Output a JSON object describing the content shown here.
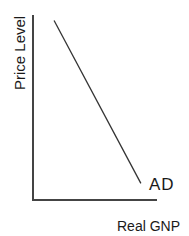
{
  "chart_data": {
    "type": "line",
    "title": "",
    "xlabel": "Real GNP",
    "ylabel": "Price Level",
    "xlim": [
      0,
      1
    ],
    "ylim": [
      0,
      1
    ],
    "grid": false,
    "ticks": false,
    "series": [
      {
        "name": "AD",
        "label": "AD",
        "points": [
          [
            0.17,
            0.97
          ],
          [
            0.87,
            0.09
          ]
        ],
        "color": "#333333"
      }
    ],
    "axis_color": "#444444"
  }
}
